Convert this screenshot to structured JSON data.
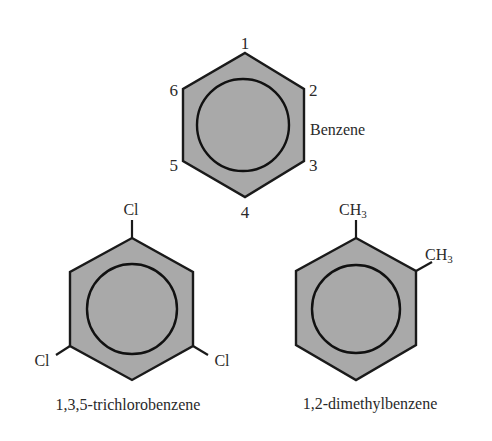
{
  "molecules": [
    {
      "name": "Benzene",
      "caption": "Benzene",
      "position_numbers": [
        "1",
        "2",
        "3",
        "4",
        "5",
        "6"
      ]
    },
    {
      "name": "1,3,5-trichlorobenzene",
      "caption": "1,3,5-trichlorobenzene",
      "substituents": [
        {
          "position": "top",
          "symbol": "Cl"
        },
        {
          "position": "lower-left",
          "symbol": "Cl"
        },
        {
          "position": "lower-right",
          "symbol": "Cl"
        }
      ]
    },
    {
      "name": "1,2-dimethylbenzene",
      "caption": "1,2-dimethylbenzene",
      "substituents": [
        {
          "position": "top",
          "symbol": "CH",
          "subscript": "3"
        },
        {
          "position": "upper-right",
          "symbol": "CH",
          "subscript": "3"
        }
      ]
    }
  ],
  "colors": {
    "ring_fill": "#a9a9a9",
    "stroke": "#1a1a1a",
    "text": "#2a2a2a",
    "background": "#ffffff"
  }
}
